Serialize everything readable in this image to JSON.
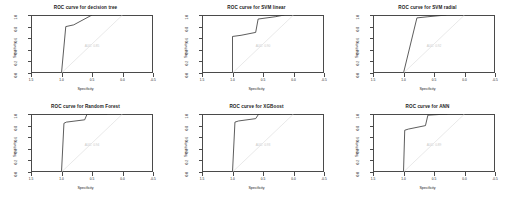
{
  "figure": {
    "rows": 2,
    "cols": 3,
    "background": "#ffffff",
    "curve_color": "#333333",
    "diagonal_color": "#e0e0e0",
    "axis_color": "#4a4a4a",
    "annotation_color": "#c9c9c9"
  },
  "axes": {
    "xlabel": "Specificity",
    "ylabel": "Sensitivity",
    "xticks": [
      "1.5",
      "1.0",
      "0.5",
      "0.0",
      "-0.5"
    ],
    "xtick_values": [
      1.5,
      1.0,
      0.5,
      0.0,
      -0.5
    ],
    "yticks": [
      "0.0",
      "0.2",
      "0.4",
      "0.6",
      "0.8",
      "1.0"
    ],
    "ytick_values": [
      0.0,
      0.2,
      0.4,
      0.6,
      0.8,
      1.0
    ],
    "xlim": [
      1.5,
      -0.5
    ],
    "ylim": [
      0.0,
      1.0
    ],
    "x_reversed": true,
    "grid": false
  },
  "chart_data": [
    {
      "type": "line",
      "title": "ROC curve for decision tree",
      "xlabel": "Specificity",
      "ylabel": "Sensitivity",
      "xlim": [
        1.5,
        -0.5
      ],
      "ylim": [
        0.0,
        1.0
      ],
      "grid": false,
      "annotation": "AUC: 0.85",
      "series": [
        {
          "name": "ROC",
          "x": [
            1.0,
            0.93,
            0.8,
            0.5,
            0.5
          ],
          "y": [
            0.0,
            0.8,
            0.83,
            1.0,
            1.0
          ]
        },
        {
          "name": "chance-diagonal",
          "x": [
            1.0,
            0.0
          ],
          "y": [
            0.0,
            1.0
          ]
        }
      ]
    },
    {
      "type": "line",
      "title": "ROC curve for SVM linear",
      "xlabel": "Specificity",
      "ylabel": "Sensitivity",
      "xlim": [
        1.5,
        -0.5
      ],
      "ylim": [
        0.0,
        1.0
      ],
      "grid": false,
      "annotation": "AUC: 0.90",
      "series": [
        {
          "name": "ROC",
          "x": [
            1.0,
            1.0,
            0.86,
            0.62,
            0.58,
            0.3,
            0.15
          ],
          "y": [
            0.0,
            0.63,
            0.65,
            0.7,
            0.93,
            0.97,
            1.0
          ]
        },
        {
          "name": "chance-diagonal",
          "x": [
            1.0,
            0.0
          ],
          "y": [
            0.0,
            1.0
          ]
        }
      ]
    },
    {
      "type": "line",
      "title": "ROC curve for SVM radial",
      "xlabel": "Specificity",
      "ylabel": "Sensitivity",
      "xlim": [
        1.5,
        -0.5
      ],
      "ylim": [
        0.0,
        1.0
      ],
      "grid": false,
      "annotation": "AUC: 0.92",
      "series": [
        {
          "name": "ROC",
          "x": [
            1.0,
            0.78,
            0.6,
            0.3
          ],
          "y": [
            0.0,
            0.95,
            0.97,
            1.0
          ]
        },
        {
          "name": "chance-diagonal",
          "x": [
            1.0,
            0.0
          ],
          "y": [
            0.0,
            1.0
          ]
        }
      ]
    },
    {
      "type": "line",
      "title": "ROC curve for Random Forest",
      "xlabel": "Specificity",
      "ylabel": "Sensitivity",
      "xlim": [
        1.5,
        -0.5
      ],
      "ylim": [
        0.0,
        1.0
      ],
      "grid": false,
      "annotation": "AUC: 0.94",
      "series": [
        {
          "name": "ROC",
          "x": [
            1.0,
            0.96,
            0.92,
            0.62,
            0.58,
            0.25
          ],
          "y": [
            0.0,
            0.84,
            0.86,
            0.9,
            1.0,
            1.0
          ]
        },
        {
          "name": "chance-diagonal",
          "x": [
            1.0,
            0.0
          ],
          "y": [
            0.0,
            1.0
          ]
        }
      ]
    },
    {
      "type": "line",
      "title": "ROC curve for XGBoost",
      "xlabel": "Specificity",
      "ylabel": "Sensitivity",
      "xlim": [
        1.5,
        -0.5
      ],
      "ylim": [
        0.0,
        1.0
      ],
      "grid": false,
      "annotation": "AUC: 0.93",
      "series": [
        {
          "name": "ROC",
          "x": [
            1.0,
            0.96,
            0.9,
            0.62,
            0.57,
            0.22
          ],
          "y": [
            0.0,
            0.86,
            0.88,
            0.92,
            1.0,
            1.0
          ]
        },
        {
          "name": "chance-diagonal",
          "x": [
            1.0,
            0.0
          ],
          "y": [
            0.0,
            1.0
          ]
        }
      ]
    },
    {
      "type": "line",
      "title": "ROC curve for ANN",
      "xlabel": "Specificity",
      "ylabel": "Sensitivity",
      "xlim": [
        1.5,
        -0.5
      ],
      "ylim": [
        0.0,
        1.0
      ],
      "grid": false,
      "annotation": "AUC: 0.89",
      "series": [
        {
          "name": "ROC",
          "x": [
            1.0,
            0.98,
            0.92,
            0.64,
            0.6,
            0.28
          ],
          "y": [
            0.0,
            0.72,
            0.74,
            0.8,
            0.98,
            1.0
          ]
        },
        {
          "name": "chance-diagonal",
          "x": [
            1.0,
            0.0
          ],
          "y": [
            0.0,
            1.0
          ]
        }
      ]
    }
  ]
}
